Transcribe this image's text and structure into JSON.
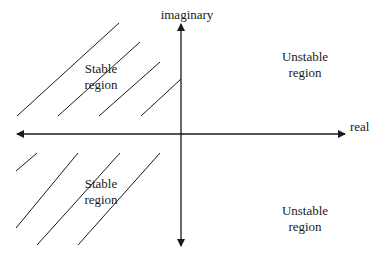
{
  "diagram": {
    "axes": {
      "horizontal_label": "real",
      "vertical_label": "imaginary"
    },
    "regions": {
      "upper_left": {
        "line1": "Stable",
        "line2": "region"
      },
      "upper_right": {
        "line1": "Unstable",
        "line2": "region"
      },
      "lower_left": {
        "line1": "Stable",
        "line2": "region"
      },
      "lower_right": {
        "line1": "Unstable",
        "line2": "region"
      }
    },
    "colors": {
      "ink": "#1a1a1a",
      "background": "#ffffff"
    }
  }
}
